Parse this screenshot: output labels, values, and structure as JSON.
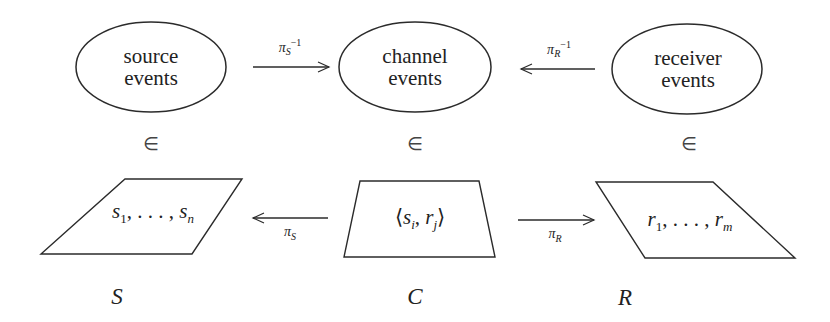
{
  "diagram": {
    "nodes_top": [
      {
        "id": "source-events",
        "line1": "source",
        "line2": "events"
      },
      {
        "id": "channel-events",
        "line1": "channel",
        "line2": "events"
      },
      {
        "id": "receiver-events",
        "line1": "receiver",
        "line2": "events"
      }
    ],
    "top_arrows": [
      {
        "from": "source-events",
        "to": "channel-events",
        "label_base": "π",
        "label_sub": "S",
        "label_sup": "−1"
      },
      {
        "from": "receiver-events",
        "to": "channel-events",
        "label_base": "π",
        "label_sub": "R",
        "label_sup": "−1"
      }
    ],
    "membership_symbol": "∈",
    "nodes_bottom": [
      {
        "id": "S",
        "content_pre": "s",
        "content": "1, . . . , s",
        "content_sub_1": "1",
        "content_sub_2": "n",
        "set_label": "S"
      },
      {
        "id": "C",
        "content_open": "⟨",
        "content_a": "s",
        "content_a_sub": "i",
        "content_sep": ", ",
        "content_b": "r",
        "content_b_sub": "j",
        "content_close": "⟩",
        "set_label": "C"
      },
      {
        "id": "R",
        "content_pre": "r",
        "content_sub_1": "1",
        "content_sub_2": "m",
        "set_label": "R"
      }
    ],
    "bottom_arrows": [
      {
        "from": "C",
        "to": "S",
        "label_base": "π",
        "label_sub": "S"
      },
      {
        "from": "C",
        "to": "R",
        "label_base": "π",
        "label_sub": "R"
      }
    ],
    "sequence_separator": ", . . . , ",
    "stroke_color": "#2b2b2b",
    "background_color": "#ffffff"
  }
}
